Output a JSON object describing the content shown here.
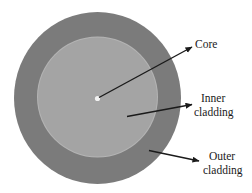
{
  "layers": [
    {
      "id": "outer",
      "name": "Outer cladding",
      "color": "#7b7b7b"
    },
    {
      "id": "inner",
      "name": "Inner cladding",
      "color": "#a4a4a4"
    },
    {
      "id": "core",
      "name": "Core",
      "color": "#f2f2f2"
    }
  ],
  "labels": {
    "core": [
      "Core"
    ],
    "inner": [
      "Inner",
      "cladding"
    ],
    "outer": [
      "Outer",
      "cladding"
    ]
  },
  "colors": {
    "arrow": "#1a1a1a",
    "background": "#ffffff"
  }
}
